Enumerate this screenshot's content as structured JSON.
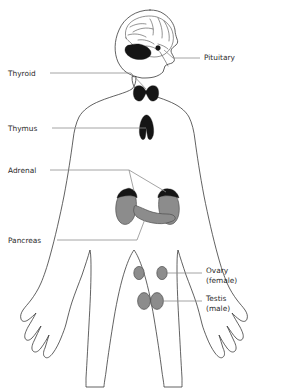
{
  "figure": {
    "view": "anterior full-body outline",
    "colors": {
      "background": "#ffffff",
      "outline": "#3a3a3a",
      "leader_line": "#8d8d8d",
      "label_text": "#2b2b2b",
      "organ_dark": "#151515",
      "organ_gray": "#8c8c8c",
      "organ_gray_stroke": "#4d4d4d"
    }
  },
  "labels": {
    "pituitary": {
      "text": "Pituitary",
      "side": "right",
      "x": 204,
      "y": 60
    },
    "thyroid": {
      "text": "Thyroid",
      "side": "left",
      "x": 8,
      "y": 76
    },
    "thymus": {
      "text": "Thymus",
      "side": "left",
      "x": 8,
      "y": 130
    },
    "adrenal": {
      "text": "Adrenal",
      "side": "left",
      "x": 8,
      "y": 173
    },
    "pancreas": {
      "text": "Pancreas",
      "side": "left",
      "x": 8,
      "y": 242
    },
    "ovary": {
      "line1": "Ovary",
      "line2": "(female)",
      "side": "right",
      "x": 206,
      "y": 275
    },
    "testis": {
      "line1": "Testis",
      "line2": "(male)",
      "side": "right",
      "x": 206,
      "y": 303
    }
  },
  "organs": [
    {
      "name": "pituitary",
      "style": "dark-dot",
      "shade": "#151515"
    },
    {
      "name": "cerebellum",
      "style": "dark-region",
      "shade": "#151515"
    },
    {
      "name": "thyroid",
      "style": "butterfly",
      "shade": "#151515"
    },
    {
      "name": "thymus",
      "style": "bilobed",
      "shade": "#151515"
    },
    {
      "name": "adrenal-left",
      "style": "cap",
      "shade": "#151515"
    },
    {
      "name": "adrenal-right",
      "style": "cap",
      "shade": "#151515"
    },
    {
      "name": "kidney-left",
      "style": "bean",
      "shade": "#8c8c8c"
    },
    {
      "name": "kidney-right",
      "style": "bean",
      "shade": "#8c8c8c"
    },
    {
      "name": "pancreas",
      "style": "elongated",
      "shade": "#8c8c8c"
    },
    {
      "name": "ovary-left",
      "style": "small-ellipse",
      "shade": "#8c8c8c"
    },
    {
      "name": "ovary-right",
      "style": "small-ellipse",
      "shade": "#8c8c8c"
    },
    {
      "name": "testis-left",
      "style": "ellipse",
      "shade": "#8c8c8c"
    },
    {
      "name": "testis-right",
      "style": "ellipse",
      "shade": "#8c8c8c"
    }
  ]
}
